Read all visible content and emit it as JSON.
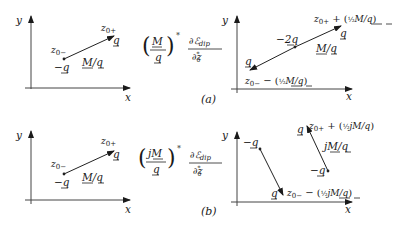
{
  "figure": {
    "panel_a": {
      "caption": "(a)",
      "left_plot": {
        "axis_x": "x",
        "axis_y": "y",
        "start_label": "z0−",
        "start_charge": "−q",
        "end_label": "z0+",
        "end_charge": "q",
        "vector_label": "M/q"
      },
      "operator": {
        "numerator": "M",
        "denominator": "q",
        "conj": "*",
        "deriv_num": "∂ℰdip",
        "deriv_den": "∂z0*"
      },
      "right_plot": {
        "axis_x": "x",
        "axis_y": "y",
        "start_charge": "q",
        "start_label": "z0− − (½M/q)",
        "mid_charge": "−2q",
        "end_charge": "q",
        "end_label": "z0+ + (½M/q)",
        "vector_label": "M/q"
      }
    },
    "panel_b": {
      "caption": "(b)",
      "left_plot": {
        "axis_x": "x",
        "axis_y": "y",
        "start_label": "z0−",
        "start_charge": "−q",
        "end_label": "z0+",
        "end_charge": "q",
        "vector_label": "M/q"
      },
      "operator": {
        "numerator": "jM",
        "denominator": "q",
        "conj": "*",
        "deriv_num": "∂ℰdip",
        "deriv_den": "∂z0*"
      },
      "right_plot": {
        "axis_x": "x",
        "axis_y": "y",
        "dipole1_top_charge": "−q",
        "dipole1_bottom_charge": "q",
        "dipole1_bottom_label": "z0− − (½jM/q)",
        "dipole2_bottom_charge": "−q",
        "dipole2_top_charge": "q",
        "dipole2_top_label": "z0+ + (½jM/q)",
        "vector_label": "jM/q"
      }
    }
  }
}
